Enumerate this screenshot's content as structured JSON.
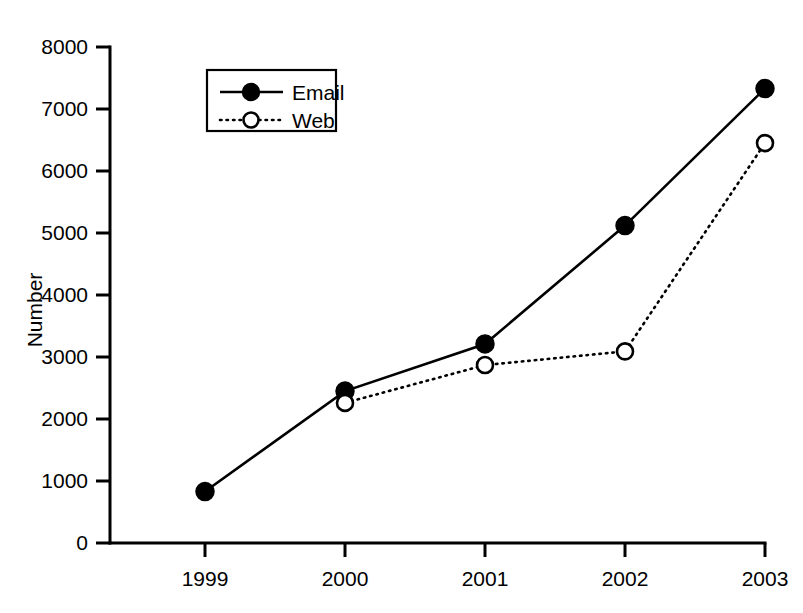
{
  "chart_data": {
    "type": "line",
    "title": "",
    "subtitle": "",
    "xlabel": "",
    "ylabel": "Number",
    "categories": [
      "1999",
      "2000",
      "2001",
      "2002",
      "2003"
    ],
    "x": [
      1999,
      2000,
      2001,
      2002,
      2003
    ],
    "xlim": [
      1998.5,
      2003.0
    ],
    "ylim": [
      0,
      8000
    ],
    "ytick_labels": [
      "0",
      "1000",
      "2000",
      "3000",
      "4000",
      "5000",
      "6000",
      "7000",
      "8000"
    ],
    "ytick_values": [
      0,
      1000,
      2000,
      3000,
      4000,
      5000,
      6000,
      7000,
      8000
    ],
    "xtick_labels": [
      "1999",
      "2000",
      "2001",
      "2002",
      "2003"
    ],
    "grid": false,
    "legend_position": "upper-left-inside",
    "series": [
      {
        "name": "Email",
        "line_style": "solid",
        "marker": "filled-circle",
        "color": "#000000",
        "values": [
          830,
          2450,
          3210,
          5120,
          7330
        ]
      },
      {
        "name": "Web",
        "line_style": "dotted",
        "marker": "open-circle",
        "color": "#000000",
        "values": [
          null,
          2260,
          2870,
          3090,
          6450
        ]
      }
    ]
  },
  "legend": {
    "items": [
      {
        "label": "Email"
      },
      {
        "label": "Web"
      }
    ]
  },
  "axes": {
    "y_title": "Number"
  }
}
